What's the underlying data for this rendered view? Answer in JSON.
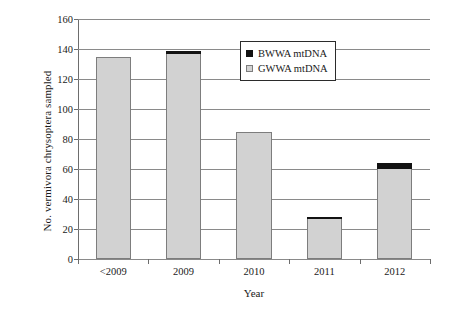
{
  "chart_data": {
    "type": "bar",
    "stacked": true,
    "title": "",
    "xlabel": "Year",
    "ylabel": "No. vermivora chrysoptera sampled",
    "categories": [
      "<2009",
      "2009",
      "2010",
      "2011",
      "2012"
    ],
    "ylim": [
      0,
      160
    ],
    "yticks": [
      0,
      20,
      40,
      60,
      80,
      100,
      120,
      140,
      160
    ],
    "ytick_labels": [
      "0",
      "20",
      "40",
      "60",
      "80",
      "100",
      "120",
      "140",
      "160"
    ],
    "grid": "horizontal",
    "legend_position": "upper right",
    "series": [
      {
        "name": "GWWA mtDNA",
        "color": "#d2d2d2",
        "values": [
          135,
          137,
          85,
          27,
          60
        ]
      },
      {
        "name": "BWWA mtDNA",
        "color": "#121212",
        "values": [
          0,
          2,
          0,
          1,
          4
        ]
      }
    ],
    "totals": [
      135,
      139,
      85,
      28,
      64
    ]
  },
  "legend": {
    "items": [
      {
        "label": "BWWA mtDNA",
        "swatch": "black-square-icon"
      },
      {
        "label": "GWWA mtDNA",
        "swatch": "gray-square-icon"
      }
    ]
  }
}
